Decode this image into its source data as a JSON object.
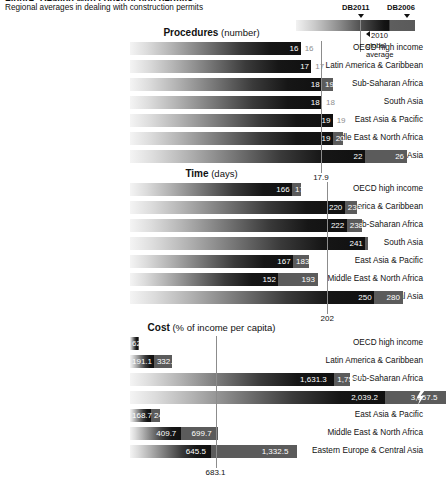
{
  "header": {
    "cut_title": "Figure: Dealing with construction permits",
    "subtitle": "Regional averages in dealing with construction permits"
  },
  "legend": {
    "label_new": "DB2011",
    "label_old": "DB2006",
    "note_line1": "2010",
    "note_line2": "global",
    "note_line3": "average",
    "arrow_icon": "down-arrow-icon",
    "pointer_icon": "left-arrow-icon"
  },
  "chart_data": [
    {
      "type": "bar",
      "title": "Procedures",
      "unit": "(number)",
      "orientation": "horizontal",
      "categories": [
        "OECD high income",
        "Latin America & Caribbean",
        "Sub-Saharan Africa",
        "South Asia",
        "East Asia & Pacific",
        "Middle East & North Africa",
        "Eastern Europe & Central Asia"
      ],
      "series": [
        {
          "name": "DB2011",
          "values": [
            16,
            17,
            18,
            18,
            19,
            19,
            22
          ]
        },
        {
          "name": "DB2006",
          "values": [
            16,
            17,
            19,
            18,
            19,
            20,
            26
          ]
        }
      ],
      "labels_db2011": [
        "16",
        "17",
        "18",
        "18",
        "19",
        "19",
        "22"
      ],
      "labels_db2006": [
        "16",
        "17",
        "19",
        "18",
        "19",
        "20",
        "26"
      ],
      "reference_line": {
        "label": "17.9",
        "value": 17.9,
        "name": "2010 global average"
      },
      "xlim": [
        0,
        27
      ],
      "grid": false
    },
    {
      "type": "bar",
      "title": "Time",
      "unit": "(days)",
      "orientation": "horizontal",
      "categories": [
        "OECD high income",
        "Latin America & Caribbean",
        "Sub-Saharan Africa",
        "South Asia",
        "East Asia & Pacific",
        "Middle East & North Africa",
        "Eastern Europe & Central Asia"
      ],
      "series": [
        {
          "name": "DB2011",
          "values": [
            166,
            220,
            222,
            241,
            167,
            152,
            250
          ]
        },
        {
          "name": "DB2006",
          "values": [
            175,
            233,
            238,
            244,
            183,
            193,
            280
          ]
        }
      ],
      "labels_db2011": [
        "166",
        "220",
        "222",
        "241",
        "167",
        "152",
        "250"
      ],
      "labels_db2006": [
        "175",
        "233",
        "238",
        "244",
        "183",
        "193",
        "280"
      ],
      "reference_line": {
        "label": "202",
        "value": 202,
        "name": "2010 global average"
      },
      "xlim": [
        0,
        295
      ],
      "grid": false
    },
    {
      "type": "bar",
      "title": "Cost",
      "unit": "(% of income per capita)",
      "orientation": "horizontal",
      "categories": [
        "OECD high income",
        "Latin America & Caribbean",
        "Sub-Saharan Africa",
        "South Asia",
        "East Asia & Pacific",
        "Middle East & North Africa",
        "Eastern Europe & Central Asia"
      ],
      "series": [
        {
          "name": "DB2011",
          "values": [
            62.1,
            191.1,
            1631.3,
            2039.2,
            168.7,
            409.7,
            645.5
          ]
        },
        {
          "name": "DB2006",
          "values": [
            74.1,
            332.0,
            1753.7,
            3957.5,
            240.9,
            699.7,
            1332.5
          ]
        }
      ],
      "labels_db2011": [
        "62.1",
        "191.1",
        "1,631.3",
        "2,039.2",
        "168.7",
        "409.7",
        "645.5"
      ],
      "labels_db2006": [
        "74.1",
        "332.0",
        "1,753.7",
        "3,957.5",
        "240.9",
        "699.7",
        "1,332.5"
      ],
      "reference_line": {
        "label": "683.1",
        "value": 683.1,
        "name": "2010 global average"
      },
      "axis_break": true,
      "xlim": [
        0,
        2300
      ],
      "grid": false
    }
  ],
  "colors": {
    "db2011_dark": "#101010",
    "db2011_light": "#f4f4f4",
    "db2006": "#5b5b5b",
    "reference_line": "#8c8c8c",
    "outside_label": "#8e8e8e",
    "text": "#111111"
  }
}
